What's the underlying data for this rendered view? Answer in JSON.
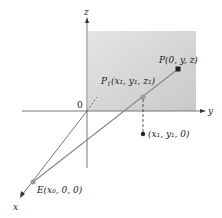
{
  "diagram": {
    "axes": {
      "x": "x",
      "y": "y",
      "z": "z",
      "origin": "0"
    },
    "points": {
      "P": "P(0, y, z)",
      "P1_name": "P",
      "P1_sub": "1",
      "P1_coords": "(x₁, y₁, z₁)",
      "E": "E(x₀, 0, 0)",
      "proj": "(x₁, y₁, 0)"
    },
    "colors": {
      "plane": "#d9d9d9",
      "axis": "#777777",
      "ray": "#8a8a8a",
      "point_dark": "#222222",
      "point_gray": "#9a9a9a"
    }
  }
}
